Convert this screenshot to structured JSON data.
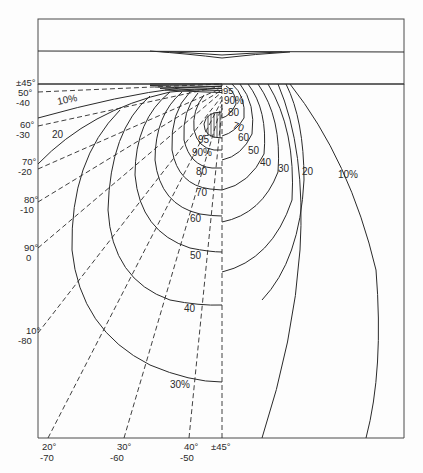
{
  "figure": {
    "type": "stress contour diagram",
    "top_panel": {
      "description": "plate with shallow indentation"
    },
    "left_axis_labels": [
      {
        "top": "±45°",
        "bottom": ""
      },
      {
        "top": "50°",
        "bottom": "-40"
      },
      {
        "top": "60°",
        "bottom": "-30"
      },
      {
        "top": "70°",
        "bottom": "-20"
      },
      {
        "top": "80°",
        "bottom": "-10"
      },
      {
        "top": "90°",
        "bottom": "0"
      },
      {
        "top": "10°",
        "bottom": "-80"
      }
    ],
    "bottom_axis_labels": [
      {
        "top": "20°",
        "bottom": "-70"
      },
      {
        "top": "30°",
        "bottom": "-60"
      },
      {
        "top": "40°",
        "bottom": "-50"
      },
      {
        "top": "±45°",
        "bottom": ""
      }
    ],
    "left_contour_labels": [
      "10%",
      "20",
      "30%",
      "40",
      "50",
      "60",
      "70",
      "80",
      "90%",
      "95"
    ],
    "right_contour_labels": [
      "90%",
      "80",
      "70",
      "60",
      "50",
      "40",
      "30",
      "20",
      "10%"
    ],
    "top_small_label": "95"
  }
}
